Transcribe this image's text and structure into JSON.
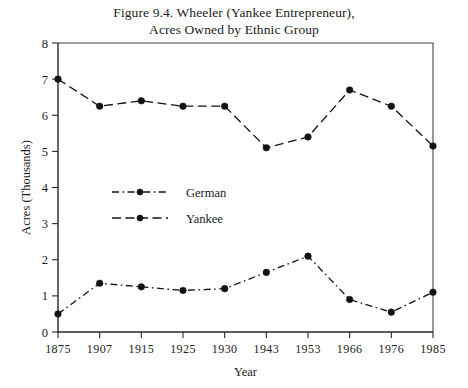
{
  "figure": {
    "title_line1": "Figure 9.4.  Wheeler (Yankee Entrepreneur),",
    "title_line2": "Acres Owned by Ethnic Group"
  },
  "chart_data": {
    "type": "line",
    "title": "Figure 9.4.  Wheeler (Yankee Entrepreneur), Acres Owned by Ethnic Group",
    "xlabel": "Year",
    "ylabel": "Acres (Thousands)",
    "categories": [
      "1875",
      "1907",
      "1915",
      "1925",
      "1930",
      "1943",
      "1953",
      "1966",
      "1976",
      "1985"
    ],
    "ylim": [
      0,
      8
    ],
    "yticks": [
      0,
      1,
      2,
      3,
      4,
      5,
      6,
      7,
      8
    ],
    "ytick_labels": [
      "0",
      "1",
      "2",
      "3",
      "4",
      "5",
      "6",
      "7",
      "8"
    ],
    "grid": false,
    "legend_position": "center-left",
    "series": [
      {
        "name": "German",
        "line_style": "dash-dot",
        "marker": "circle",
        "color": "#15120f",
        "values": [
          0.5,
          1.35,
          1.25,
          1.15,
          1.2,
          1.65,
          2.1,
          0.9,
          0.55,
          1.1
        ]
      },
      {
        "name": "Yankee",
        "line_style": "dashed",
        "marker": "circle",
        "color": "#15120f",
        "values": [
          7.0,
          6.25,
          6.4,
          6.25,
          6.25,
          5.1,
          5.4,
          6.7,
          6.25,
          5.15
        ]
      }
    ]
  },
  "legend": {
    "entries": [
      {
        "label": "German"
      },
      {
        "label": "Yankee"
      }
    ]
  }
}
